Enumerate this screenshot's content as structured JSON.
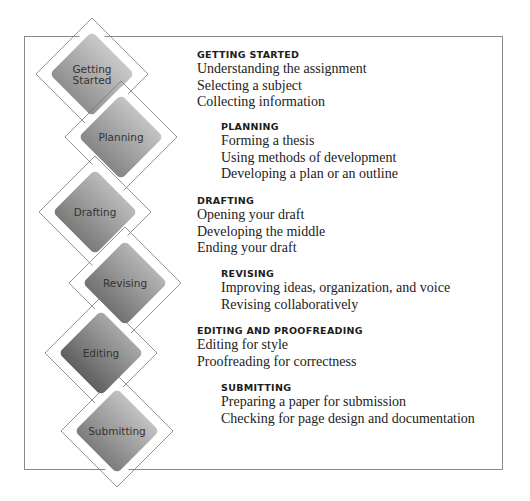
{
  "diagram": {
    "stages": [
      {
        "label": "Getting Started",
        "label_lines": [
          "Getting",
          "Started"
        ],
        "heading": "GETTING STARTED",
        "items": [
          "Understanding the assignment",
          "Selecting a subject",
          "Collecting information"
        ],
        "shade": {
          "light": "#c9c9c9",
          "dark": "#8e8e8e"
        }
      },
      {
        "label": "Planning",
        "label_lines": [
          "Planning"
        ],
        "heading": "PLANNING",
        "items": [
          "Forming a thesis",
          "Using methods of development",
          "Developing a plan or an outline"
        ],
        "shade": {
          "light": "#c4c4c4",
          "dark": "#858585"
        }
      },
      {
        "label": "Drafting",
        "label_lines": [
          "Drafting"
        ],
        "heading": "DRAFTING",
        "items": [
          "Opening your draft",
          "Developing the middle",
          "Ending your draft"
        ],
        "shade": {
          "light": "#bbbbbb",
          "dark": "#7a7a7a"
        }
      },
      {
        "label": "Revising",
        "label_lines": [
          "Revising"
        ],
        "heading": "REVISING",
        "items": [
          "Improving ideas, organization, and voice",
          "Revising collaboratively"
        ],
        "shade": {
          "light": "#b5b5b5",
          "dark": "#717171"
        }
      },
      {
        "label": "Editing",
        "label_lines": [
          "Editing"
        ],
        "heading": "EDITING AND PROOFREADING",
        "items": [
          "Editing for style",
          "Proofreading for correctness"
        ],
        "shade": {
          "light": "#a8a8a8",
          "dark": "#5f5f5f"
        }
      },
      {
        "label": "Submitting",
        "label_lines": [
          "Submitting"
        ],
        "heading": "SUBMITTING",
        "items": [
          "Preparing a paper for submission",
          "Checking for page design and documentation"
        ],
        "shade": {
          "light": "#c2c2c2",
          "dark": "#7c7c7c"
        }
      }
    ],
    "colors": {
      "outline": "#777777",
      "text": "#222222",
      "frame": "#8a8a8a"
    }
  }
}
